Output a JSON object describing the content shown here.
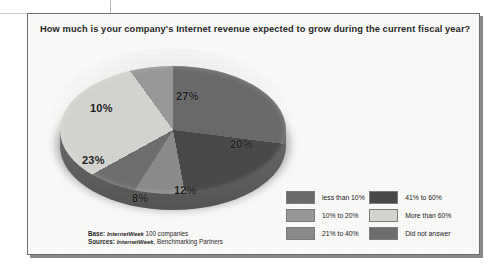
{
  "title": "How much is your company's Internet revenue expected to grow during the current fiscal year?",
  "source": {
    "base_label": "Base:",
    "base_publication": "InternetWeek",
    "base_rest": "100 companies",
    "sources_label": "Sources:",
    "sources_publication": "InternetWeek",
    "sources_rest": ", Benchmarking Partners"
  },
  "legend": {
    "left": [
      {
        "label": "less than 10%",
        "color": "#6b6b6b"
      },
      {
        "label": "10% to 20%",
        "color": "#9a9a9a"
      },
      {
        "label": "21% to 40%",
        "color": "#8c8c8c"
      }
    ],
    "right": [
      {
        "label": "41% to 60%",
        "color": "#4a4a4a"
      },
      {
        "label": "More than 60%",
        "color": "#d5d5d2"
      },
      {
        "label": "Did not answer",
        "color": "#6f6f6f"
      }
    ]
  },
  "slice_labels": [
    {
      "text": "27%",
      "x": 138,
      "y": 48
    },
    {
      "text": "20%",
      "x": 192,
      "y": 96
    },
    {
      "text": "12%",
      "x": 136,
      "y": 142
    },
    {
      "text": "8%",
      "x": 94,
      "y": 150
    },
    {
      "text": "23%",
      "x": 44,
      "y": 112
    },
    {
      "text": "10%",
      "x": 52,
      "y": 60
    }
  ],
  "chart_data": {
    "type": "pie",
    "title": "How much is your company's Internet revenue expected to grow during the current fiscal year?",
    "subtitle": "",
    "xlabel": "",
    "ylabel": "",
    "units": "percent of respondents",
    "legend_position": "bottom-right",
    "grid": false,
    "three_d": true,
    "exploded_slices": [
      "41% to 60%"
    ],
    "start_angle_deg": 0,
    "direction": "clockwise",
    "categories": [
      "less than 10%",
      "41% to 60%",
      "21% to 40%",
      "Did not answer",
      "More than 60%",
      "10% to 20%"
    ],
    "values": [
      27,
      20,
      12,
      8,
      23,
      10
    ],
    "slices": [
      {
        "label": "less than 10%",
        "value": 27,
        "display": "27%",
        "color": "#6b6b6b"
      },
      {
        "label": "41% to 60%",
        "value": 20,
        "display": "20%",
        "color": "#4a4a4a"
      },
      {
        "label": "21% to 40%",
        "value": 12,
        "display": "12%",
        "color": "#8c8c8c"
      },
      {
        "label": "Did not answer",
        "value": 8,
        "display": "8%",
        "color": "#6f6f6f"
      },
      {
        "label": "More than 60%",
        "value": 23,
        "display": "23%",
        "color": "#d5d5d2"
      },
      {
        "label": "10% to 20%",
        "value": 10,
        "display": "10%",
        "color": "#9a9a9a"
      }
    ],
    "total": 100,
    "base": "InternetWeek 100 companies",
    "sources": "InternetWeek, Benchmarking Partners"
  }
}
